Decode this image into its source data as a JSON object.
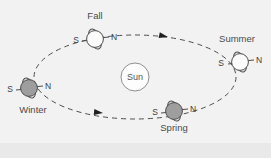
{
  "figure": {
    "background_color": "#f2f2f2",
    "line_color": "#4a4a4a",
    "earth_light_color": "#fbfbfb",
    "earth_shaded_color": "#9a9a9a",
    "sun_fill": "#fdfdfd",
    "sun_stroke": "#8c8c8c",
    "bottom_band_color": "#e6e6e6"
  },
  "sun": {
    "label": "Sun",
    "cx": 135,
    "cy": 77,
    "r": 14
  },
  "orbit": {
    "cx": 135,
    "cy": 77,
    "rx": 101,
    "ry": 42,
    "style": "dashed",
    "direction": "counterclockwise",
    "arrows": [
      {
        "name": "orbit-arrow-top",
        "x": 165,
        "y": 38,
        "angle": 192
      },
      {
        "name": "orbit-arrow-bottom",
        "x": 100,
        "y": 112,
        "angle": 185
      }
    ]
  },
  "earths": [
    {
      "id": "fall",
      "label": "Fall",
      "label_x": 95,
      "label_y": 17,
      "cx": 95,
      "cy": 39,
      "r": 9,
      "shaded": false,
      "tilt": -22,
      "pole_left": "S",
      "pole_right": "N",
      "pole_left_x": 76,
      "pole_left_y": 42,
      "pole_right_x": 113,
      "pole_right_y": 39
    },
    {
      "id": "summer",
      "label": "Summer",
      "label_x": 235,
      "label_y": 40,
      "cx": 240,
      "cy": 62,
      "r": 9,
      "shaded": false,
      "tilt": -22,
      "pole_left": "S",
      "pole_right": "N",
      "pole_left_x": 222,
      "pole_left_y": 65,
      "pole_right_x": 258,
      "pole_right_y": 61
    },
    {
      "id": "winter",
      "label": "Winter",
      "label_x": 32,
      "label_y": 112,
      "cx": 29,
      "cy": 88,
      "r": 9,
      "shaded": true,
      "tilt": -22,
      "pole_left": "S",
      "pole_right": "N",
      "pole_left_x": 12,
      "pole_left_y": 91,
      "pole_right_x": 47,
      "pole_right_y": 87
    },
    {
      "id": "spring",
      "label": "Spring",
      "label_x": 174,
      "label_y": 129,
      "cx": 174,
      "cy": 111,
      "r": 9,
      "shaded": true,
      "tilt": -22,
      "pole_left": "S",
      "pole_right": "N",
      "pole_left_x": 155,
      "pole_left_y": 113,
      "pole_right_x": 192,
      "pole_right_y": 110
    }
  ]
}
